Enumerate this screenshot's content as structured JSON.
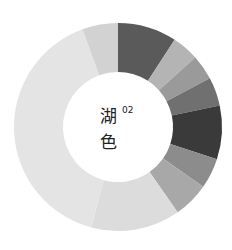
{
  "chart_data": {
    "type": "pie",
    "subtype": "donut",
    "center_label": {
      "line1": "湖",
      "line2": "色",
      "superscript": "02"
    },
    "center": [
      118,
      127
    ],
    "outer_radius": 104,
    "inner_radius": 55,
    "start_angle_deg": 0,
    "direction": "clockwise",
    "segments": [
      {
        "value": 33,
        "color": "#5a5a5a"
      },
      {
        "value": 15,
        "color": "#b4b4b4"
      },
      {
        "value": 14,
        "color": "#9a9a9a"
      },
      {
        "value": 16,
        "color": "#707070"
      },
      {
        "value": 30,
        "color": "#3a3a3a"
      },
      {
        "value": 17,
        "color": "#8c8c8c"
      },
      {
        "value": 20,
        "color": "#a8a8a8"
      },
      {
        "value": 50,
        "color": "#dcdcdc"
      },
      {
        "value": 145,
        "color": "#e4e4e4"
      },
      {
        "value": 20,
        "color": "#d2d2d2"
      }
    ]
  }
}
